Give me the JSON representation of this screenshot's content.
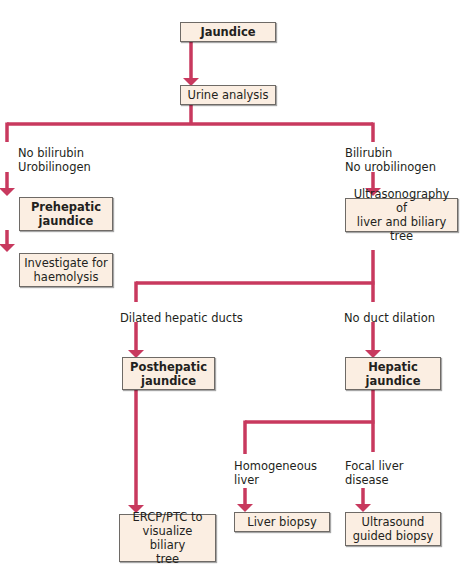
{
  "diagram": {
    "type": "flowchart",
    "colors": {
      "connector": "#c8395e",
      "box_fill": "#fbeee2",
      "box_border": "#6e6a66"
    },
    "nodes": {
      "jaundice": "Jaundice",
      "urine": "Urine analysis",
      "prehepatic": "Prehepatic\njaundice",
      "haemolysis": "Investigate for\nhaemolysis",
      "ultrasound": "Ultrasonography of\nliver and biliary tree",
      "posthepatic": "Posthepatic\njaundice",
      "hepatic": "Hepatic\njaundice",
      "ercp": "ERCP/PTC to\nvisualize biliary\ntree",
      "liver_biopsy": "Liver biopsy",
      "us_biopsy": "Ultrasound\nguided biopsy"
    },
    "edge_labels": {
      "no_bilirubin": "No bilirubin\nUrobilinogen",
      "bilirubin": "Bilirubin\nNo urobilinogen",
      "dilated": "Dilated hepatic ducts",
      "no_dilation": "No duct dilation",
      "homogeneous": "Homogeneous\nliver",
      "focal": "Focal liver\ndisease"
    }
  }
}
